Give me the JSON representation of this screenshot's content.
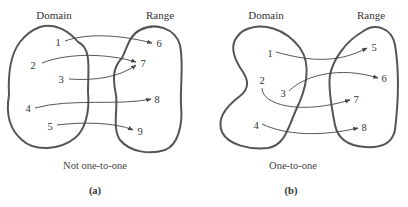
{
  "panels": [
    {
      "id": "a",
      "domain_label": "Domain",
      "range_label": "Range",
      "domain_elements": [
        "1",
        "2",
        "3",
        "4",
        "5"
      ],
      "range_elements": [
        "6",
        "7",
        "8",
        "9"
      ],
      "mappings": [
        [
          "1",
          "6"
        ],
        [
          "2",
          "7"
        ],
        [
          "3",
          "7"
        ],
        [
          "4",
          "8"
        ],
        [
          "5",
          "9"
        ]
      ],
      "caption": "Not one-to-one",
      "sublabel": "(a)"
    },
    {
      "id": "b",
      "domain_label": "Domain",
      "range_label": "Range",
      "domain_elements": [
        "1",
        "2",
        "3",
        "4"
      ],
      "range_elements": [
        "5",
        "6",
        "7",
        "8"
      ],
      "mappings": [
        [
          "1",
          "5"
        ],
        [
          "2",
          "7"
        ],
        [
          "3",
          "6"
        ],
        [
          "4",
          "8"
        ]
      ],
      "caption": "One-to-one",
      "sublabel": "(b)"
    }
  ],
  "colors": {
    "outline": "#555555",
    "arrow": "#444444",
    "text": "#333333"
  }
}
